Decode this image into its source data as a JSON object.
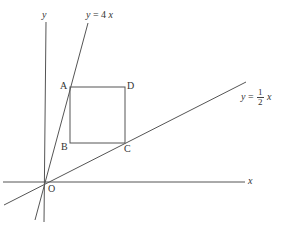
{
  "diagram": {
    "axes": {
      "x_label": "x",
      "y_label": "y",
      "origin_label": "O"
    },
    "lines": [
      {
        "name": "steep-line",
        "label_prefix": "y = 4",
        "label_var": "x",
        "equation": "y = 4x"
      },
      {
        "name": "shallow-line",
        "label_prefix": "y =",
        "frac_num": "1",
        "frac_den": "2",
        "label_var": "x",
        "equation": "y = 1/2 x"
      }
    ],
    "square": {
      "vertices": {
        "A": "A",
        "B": "B",
        "C": "C",
        "D": "D"
      }
    },
    "colors": {
      "stroke": "#555555",
      "text": "#333333",
      "background": "#ffffff"
    }
  }
}
